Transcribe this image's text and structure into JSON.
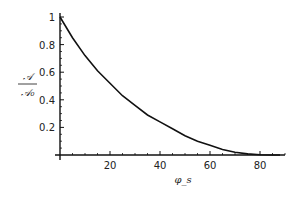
{
  "chart_data": {
    "type": "line",
    "title": "",
    "xlabel": "φ_s",
    "ylabel": "𝒜 / 𝒜₀",
    "ylabel_numerator": "𝒜",
    "ylabel_denominator": "𝒜₀",
    "xlim": [
      0,
      92
    ],
    "ylim": [
      0,
      1.0
    ],
    "x_ticks": [
      20,
      40,
      60,
      80
    ],
    "y_ticks": [
      0.2,
      0.4,
      0.6,
      0.8,
      1
    ],
    "x_tick_labels": [
      "20",
      "40",
      "60",
      "80"
    ],
    "y_tick_labels": [
      "0.2",
      "0.4",
      "0.6",
      "0.8",
      "1"
    ],
    "grid": false,
    "legend": null,
    "series": [
      {
        "name": "A/A0",
        "x": [
          0,
          5,
          10,
          15,
          20,
          25,
          30,
          35,
          40,
          45,
          50,
          55,
          60,
          65,
          70,
          75,
          80,
          85,
          90
        ],
        "values": [
          1.0,
          0.85,
          0.72,
          0.61,
          0.52,
          0.43,
          0.36,
          0.29,
          0.24,
          0.19,
          0.14,
          0.1,
          0.07,
          0.04,
          0.02,
          0.008,
          0.002,
          0.0,
          0.0
        ]
      }
    ]
  }
}
